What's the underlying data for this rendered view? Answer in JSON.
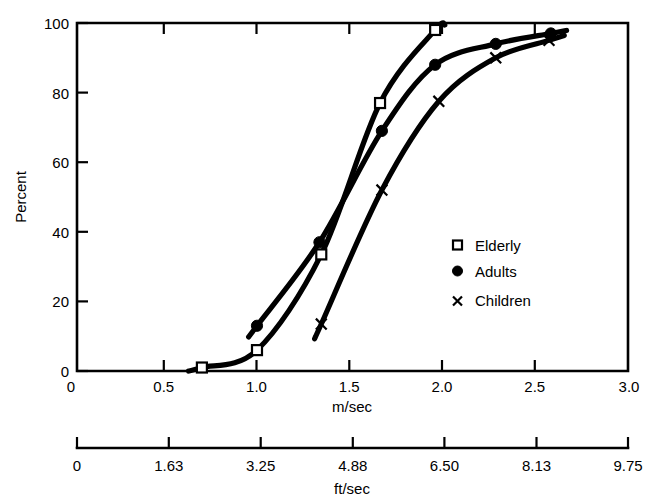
{
  "chart_data": {
    "type": "line",
    "title": "",
    "subtitle": "",
    "xlabel": "m/sec",
    "ylabel": "Percent",
    "secondary_xlabel": "ft/sec",
    "xlim": [
      0,
      3.0
    ],
    "ylim": [
      0,
      100
    ],
    "grid": false,
    "legend_position": "center-right",
    "x_ticks": [
      "0",
      "0.5",
      "1.0",
      "1.5",
      "2.0",
      "2.5",
      "3.0"
    ],
    "x_tick_values": [
      0,
      0.5,
      1.0,
      1.5,
      2.0,
      2.5,
      3.0
    ],
    "y_ticks": [
      "0",
      "20",
      "40",
      "60",
      "80",
      "100"
    ],
    "y_tick_values": [
      0,
      20,
      40,
      60,
      80,
      100
    ],
    "secondary_x_ticks": [
      "0",
      "1.63",
      "3.25",
      "4.88",
      "6.50",
      "8.13",
      "9.75"
    ],
    "secondary_x_tick_values": [
      0,
      1.63,
      3.25,
      4.88,
      6.5,
      8.13,
      9.75
    ],
    "secondary_xlim": [
      0,
      9.75
    ],
    "series": [
      {
        "name": "Elderly",
        "marker": "open-square",
        "x": [
          0.68,
          0.98,
          1.33,
          1.65,
          1.95
        ],
        "y": [
          1,
          6,
          33.5,
          77,
          98
        ]
      },
      {
        "name": "Adults",
        "marker": "filled-circle",
        "x": [
          0.98,
          1.32,
          1.66,
          1.95,
          2.28,
          2.58
        ],
        "y": [
          13,
          37,
          69,
          88,
          94,
          97
        ]
      },
      {
        "name": "Children",
        "marker": "cross",
        "x": [
          1.33,
          1.66,
          1.97,
          2.28,
          2.57
        ],
        "y": [
          13.5,
          52,
          77.5,
          90,
          95
        ]
      }
    ]
  },
  "legend": {
    "entries": [
      {
        "label": "Elderly",
        "marker": "open-square"
      },
      {
        "label": "Adults",
        "marker": "filled-circle"
      },
      {
        "label": "Children",
        "marker": "cross"
      }
    ]
  },
  "axes": {
    "primary_x_title": "m/sec",
    "secondary_x_title": "ft/sec",
    "y_title": "Percent"
  }
}
